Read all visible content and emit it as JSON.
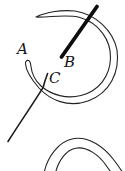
{
  "figure": {
    "labels": {
      "a": "A",
      "b": "B",
      "c": "C"
    },
    "colors": {
      "ink": "#232323",
      "rod": "#0d0d0d",
      "pin": "#1c1c1c",
      "background": "#ffffff"
    }
  }
}
